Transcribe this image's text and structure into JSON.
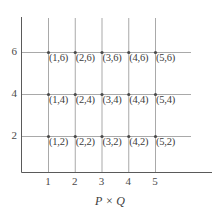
{
  "chart_data": {
    "type": "scatter",
    "title": "",
    "xlabel": "P × Q",
    "ylabel": "",
    "xlim": [
      0,
      5.9
    ],
    "ylim": [
      0,
      7.4
    ],
    "grid": true,
    "legend": "none",
    "x_ticks": [
      1,
      2,
      3,
      4,
      5
    ],
    "x_tick_labels": [
      "1",
      "2",
      "3",
      "4",
      "5"
    ],
    "y_ticks": [
      2,
      4,
      6
    ],
    "y_tick_labels": [
      "2",
      "4",
      "6"
    ],
    "points": [
      {
        "x": 1,
        "y": 6,
        "label": "(1,6)"
      },
      {
        "x": 2,
        "y": 6,
        "label": "(2,6)"
      },
      {
        "x": 3,
        "y": 6,
        "label": "(3,6)"
      },
      {
        "x": 4,
        "y": 6,
        "label": "(4,6)"
      },
      {
        "x": 5,
        "y": 6,
        "label": "(5,6)"
      },
      {
        "x": 1,
        "y": 4,
        "label": "(1,4)"
      },
      {
        "x": 2,
        "y": 4,
        "label": "(2,4)"
      },
      {
        "x": 3,
        "y": 4,
        "label": "(3,4)"
      },
      {
        "x": 4,
        "y": 4,
        "label": "(4,4)"
      },
      {
        "x": 5,
        "y": 4,
        "label": "(5,4)"
      },
      {
        "x": 1,
        "y": 2,
        "label": "(1,2)"
      },
      {
        "x": 2,
        "y": 2,
        "label": "(2,2)"
      },
      {
        "x": 3,
        "y": 2,
        "label": "(3,2)"
      },
      {
        "x": 4,
        "y": 2,
        "label": "(4,2)"
      },
      {
        "x": 5,
        "y": 2,
        "label": "(5,2)"
      }
    ],
    "colors": {
      "grid": "#a9a9a9",
      "axis": "#5a5a5a",
      "text": "#3c3c3c",
      "marker": "#4a4a4a",
      "background": "#ffffff"
    }
  }
}
